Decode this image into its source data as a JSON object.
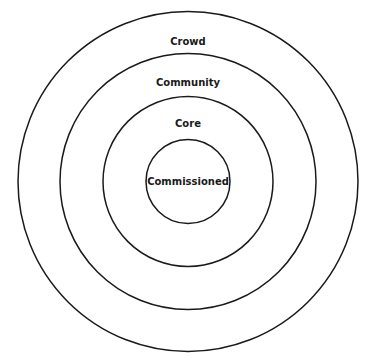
{
  "diagram": {
    "type": "concentric-circles",
    "center": [
      188,
      181.5
    ],
    "stroke_color": "#1a1a1a",
    "rings": [
      {
        "label": "Crowd",
        "radius": 170,
        "label_y": 41
      },
      {
        "label": "Community",
        "radius": 128,
        "label_y": 83
      },
      {
        "label": "Core",
        "radius": 85,
        "label_y": 125
      },
      {
        "label": "Commissioned",
        "radius": 42,
        "label_y": 185
      }
    ]
  }
}
